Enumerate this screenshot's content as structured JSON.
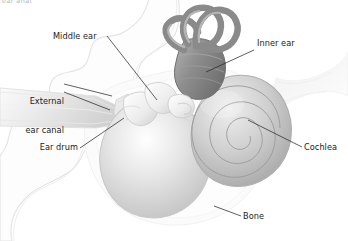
{
  "figure": {
    "title_fragment": "ear anat",
    "background_color": "#ffffff",
    "text_color": "#1b1b1b",
    "leader_line_color": "#2a2a2a"
  },
  "labels": [
    {
      "id": "middle-ear",
      "text": "Middle ear",
      "align": "left",
      "x": 53,
      "y": 32
    },
    {
      "id": "external-ear-canal",
      "line1": "External",
      "line2": "ear canal",
      "align": "right",
      "x": 14,
      "y": 78
    },
    {
      "id": "ear-drum",
      "text": "Ear drum",
      "align": "right",
      "x": 38,
      "y": 147
    },
    {
      "id": "inner-ear",
      "text": "Inner ear",
      "align": "left",
      "x": 257,
      "y": 43
    },
    {
      "id": "cochlea",
      "text": "Cochlea",
      "align": "left",
      "x": 305,
      "y": 148
    },
    {
      "id": "bone",
      "text": "Bone",
      "align": "left",
      "x": 243,
      "y": 218
    }
  ],
  "anatomy_parts": [
    {
      "id": "head-tissue-outline",
      "name": "surrounding head tissue outline",
      "fill": "#fcfcfc",
      "stroke": "#e2e2e2"
    },
    {
      "id": "external-ear-canal-shape",
      "name": "external auditory canal funnel",
      "fill": "#ededed"
    },
    {
      "id": "ear-drum-shape",
      "name": "tympanic membrane",
      "fill": "#e8e8e8"
    },
    {
      "id": "ossicles",
      "name": "malleus incus and stapes ossicles",
      "fill": "#f2f2f2"
    },
    {
      "id": "middle-ear-cavity",
      "name": "tympanic cavity bulb",
      "fill": "#dcdcdc"
    },
    {
      "id": "semicircular-canals",
      "name": "three semicircular canals",
      "fill": "#9a9a9a"
    },
    {
      "id": "vestibule",
      "name": "vestibule",
      "fill": "#8f8f8f"
    },
    {
      "id": "cochlea-shape",
      "name": "cochlea spiral",
      "fill": "#c8c8c8"
    },
    {
      "id": "eustachian-flare",
      "name": "eustachian tube flare",
      "fill": "#f4f4f4"
    },
    {
      "id": "bone-halo",
      "name": "temporal bone halo",
      "fill": "#fafafa"
    }
  ]
}
